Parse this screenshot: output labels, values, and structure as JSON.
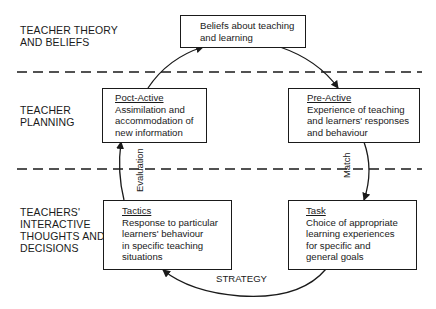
{
  "levels": [
    {
      "id": "theory",
      "label": "TEACHER THEORY\nAND BELIEFS"
    },
    {
      "id": "planning",
      "label": "TEACHER\nPLANNING"
    },
    {
      "id": "interactive",
      "label": "TEACHERS'\nINTERACTIVE\nTHOUGHTS AND\nDECISIONS"
    }
  ],
  "boxes": {
    "beliefs": {
      "title": "",
      "text": "Beliefs about teaching\nand learning"
    },
    "post_active": {
      "title": "Poct-Active",
      "text": "Assimilation and\naccommodation of\nnew information"
    },
    "pre_active": {
      "title": "Pre-Active",
      "text": "Experience of teaching\nand learners' responses\nand behaviour"
    },
    "tactics": {
      "title": "Tactics",
      "text": "Response to particular\nlearners' behaviour\nin specific teaching\nsituations"
    },
    "task": {
      "title": "Task",
      "text": "Choice of appropriate\nlearning experiences\nfor specific and\ngeneral goals"
    }
  },
  "arrow_labels": {
    "evaluation": "Evaluation",
    "match": "Match",
    "strategy": "STRATEGY"
  }
}
